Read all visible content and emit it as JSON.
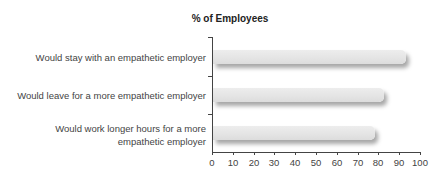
{
  "chart_data": {
    "type": "bar",
    "orientation": "horizontal",
    "title": "% of Employees",
    "categories": [
      "Would stay with an empathetic employer",
      "Would leave for a more empathetic employer",
      "Would work longer hours for a more empathetic employer"
    ],
    "values": [
      93,
      82,
      78
    ],
    "xlabel": "",
    "ylabel": "",
    "xlim": [
      0,
      100
    ],
    "xticks": [
      "0",
      "10",
      "20",
      "30",
      "40",
      "50",
      "60",
      "70",
      "80",
      "90",
      "100"
    ],
    "grid": false,
    "legend": null,
    "bar_color": "#e6e6e6"
  },
  "labels": {
    "title": "% of Employees",
    "cat0": "Would stay with an empathetic employer",
    "cat1": "Would leave for a more empathetic employer",
    "cat2a": "Would work longer hours for a more",
    "cat2b": "empathetic employer",
    "ticks": [
      "0",
      "10",
      "20",
      "30",
      "40",
      "50",
      "60",
      "70",
      "80",
      "90",
      "100"
    ]
  }
}
